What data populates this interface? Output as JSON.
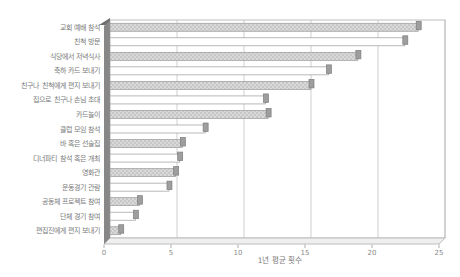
{
  "chart_data": {
    "type": "bar",
    "orientation": "horizontal",
    "title": "",
    "xlabel": "1년 평균 횟수",
    "ylabel": "",
    "xlim": [
      0,
      25
    ],
    "xticks": [
      0,
      5,
      10,
      15,
      20,
      25
    ],
    "grid": true,
    "legend": false,
    "categories": [
      "교회 예배 참석",
      "친척 방문",
      "식당에서 저녁식사",
      "축하 카드 보내기",
      "친구나 친척에게 편지 보내기",
      "집으로 친구나 손님 초대",
      "카드놀이",
      "클럽 모임 참석",
      "바 혹은 선술집",
      "디너파티 참석 혹은 개최",
      "영화관",
      "운동경기 관람",
      "공동체 프로젝트 참여",
      "단체 경기 참여",
      "편집진에게 편지 보내기"
    ],
    "values": [
      23,
      22,
      18.5,
      16.3,
      15,
      11.6,
      11.8,
      7.1,
      5.4,
      5.2,
      4.9,
      4.4,
      2.2,
      1.9,
      0.8
    ],
    "style": {
      "bar_face_hatched": "#d9d9d9",
      "bar_dot": "#a8a8a8",
      "bar_face_plain": "#ffffff",
      "bar_stroke": "#9a9a9a",
      "bar_cap_fill": "#9e9e9e",
      "bar_cap_stroke": "#7d7d7d",
      "wall_fill": "#878787",
      "wall_cap_fill": "#6e6e6e",
      "floor_fill": "#efefef",
      "frame_stroke": "#bdbdbd",
      "gridline_stroke": "#cfcfcf",
      "tick_stroke": "#9a9a9a",
      "label_color": "#7a7a7a",
      "tick_label_color": "#8a8a8a"
    }
  }
}
